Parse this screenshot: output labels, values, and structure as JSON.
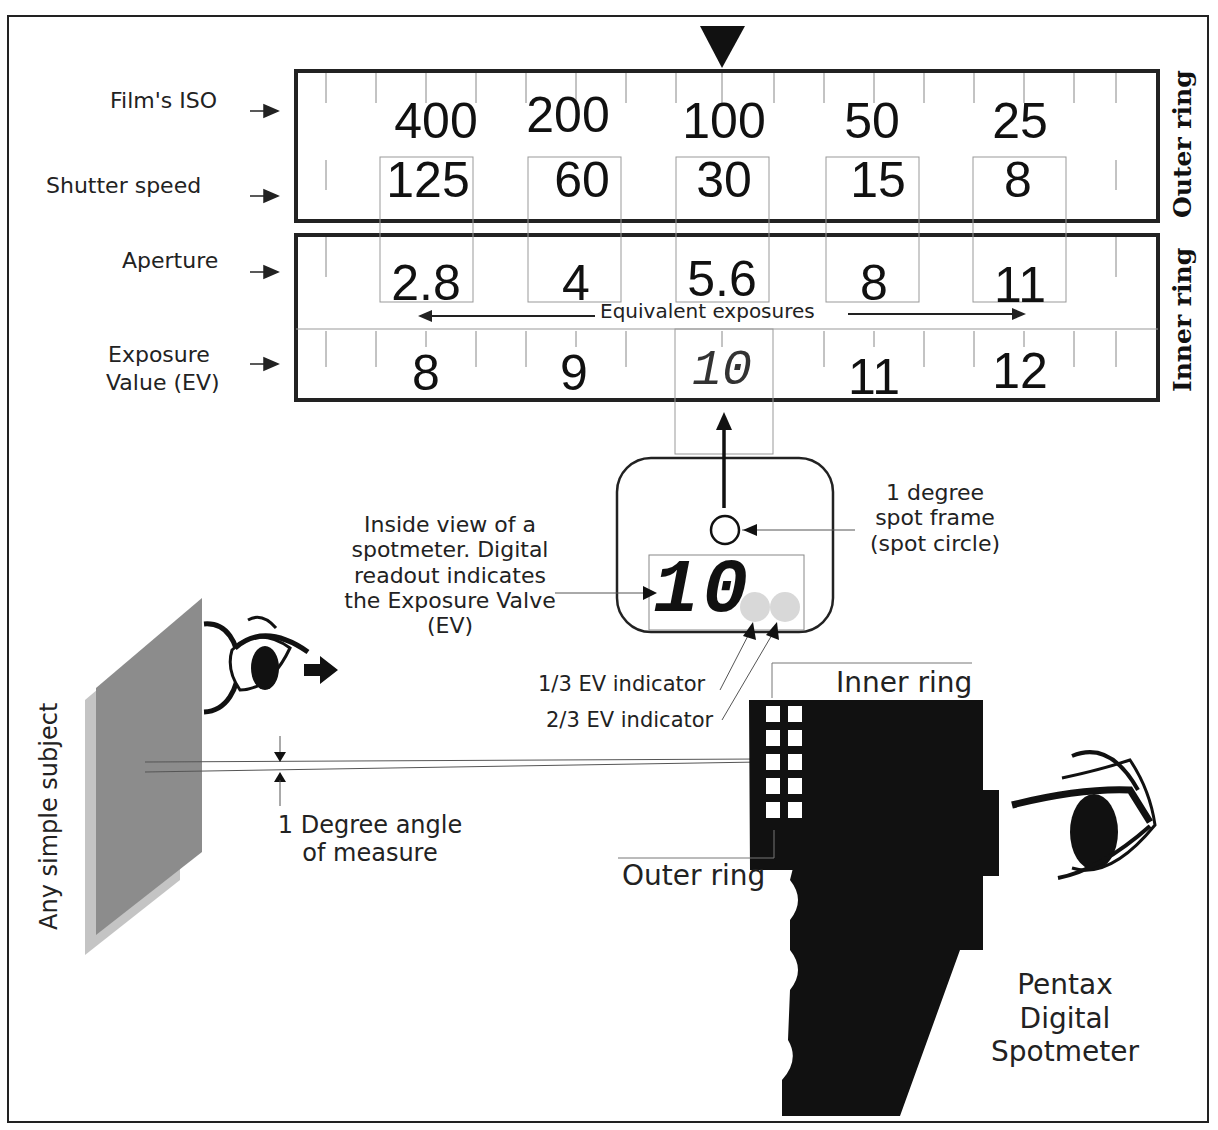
{
  "dial": {
    "outer_ring_label": "Outer ring",
    "inner_ring_label": "Inner ring",
    "row_labels": {
      "iso": "Film's ISO",
      "shutter": "Shutter speed",
      "aperture": "Aperture",
      "ev_line1": "Exposure",
      "ev_line2": "Value (EV)"
    },
    "iso_values": [
      "400",
      "200",
      "100",
      "50",
      "25"
    ],
    "shutter_values": [
      "125",
      "60",
      "30",
      "15",
      "8"
    ],
    "aperture_values": [
      "2.8",
      "4",
      "5.6",
      "8",
      "11"
    ],
    "ev_values": [
      "8",
      "9",
      "10",
      "11",
      "12"
    ],
    "equivalent_label": "Equivalent exposures",
    "pointer": "index-triangle"
  },
  "viewfinder": {
    "readout": "10",
    "description": [
      "Inside view of a",
      "spotmeter. Digital",
      "readout  indicates",
      "the Exposure Valve",
      "(EV)"
    ],
    "spot_frame_label": [
      "1 degree",
      "spot frame",
      "(spot circle)"
    ],
    "indicator_one_third": "1/3 EV indicator",
    "indicator_two_third": "2/3 EV indicator"
  },
  "scene": {
    "subject_label": "Any simple subject",
    "angle_label": [
      "1 Degree angle",
      "of measure"
    ],
    "meter_inner_ring": "Inner ring",
    "meter_outer_ring": "Outer ring",
    "meter_name": [
      "Pentax",
      "Digital",
      "Spotmeter"
    ]
  },
  "colors": {
    "ink": "#111111",
    "subject_dark": "#8c8c8c",
    "subject_light": "#c4c4c4",
    "indicator_dot": "#d8d8d8"
  }
}
